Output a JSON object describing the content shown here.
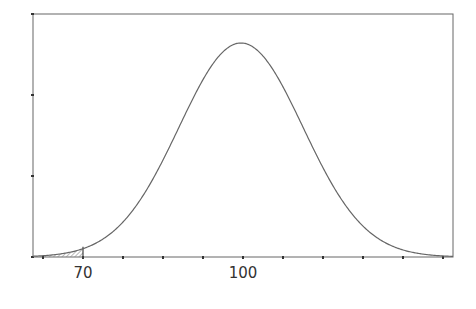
{
  "chart_data": {
    "type": "area",
    "title": "",
    "xlabel": "",
    "ylabel": "",
    "distribution": {
      "mean": 100,
      "shaded_region": {
        "from": "left-tail",
        "to": 70
      }
    },
    "x_tick_labels": [
      {
        "value": 70,
        "label": "70"
      },
      {
        "value": 100,
        "label": "100"
      }
    ],
    "x_ticks_count": 11,
    "y_ticks_count": 4,
    "y_tick_labels": [],
    "grid": false,
    "legend": null
  },
  "colors": {
    "axis": "#555555",
    "curve": "#666666",
    "shade": "#999999",
    "label": "#333333"
  }
}
